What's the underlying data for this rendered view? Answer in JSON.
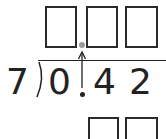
{
  "problem": {
    "divisor": "7",
    "dividend_digits": [
      "0",
      ".",
      "4",
      "2"
    ],
    "quotient_boxes": 3,
    "quotient_decimal_point": "gray-dot",
    "work_boxes": 2
  },
  "colors": {
    "ink": "#222222",
    "box_border": "#2a2a2a",
    "decimal_hint": "#9a9a9a"
  },
  "annotation": {
    "arrow": "arrow-up-icon",
    "meaning": "decimal point moves straight up into quotient"
  }
}
